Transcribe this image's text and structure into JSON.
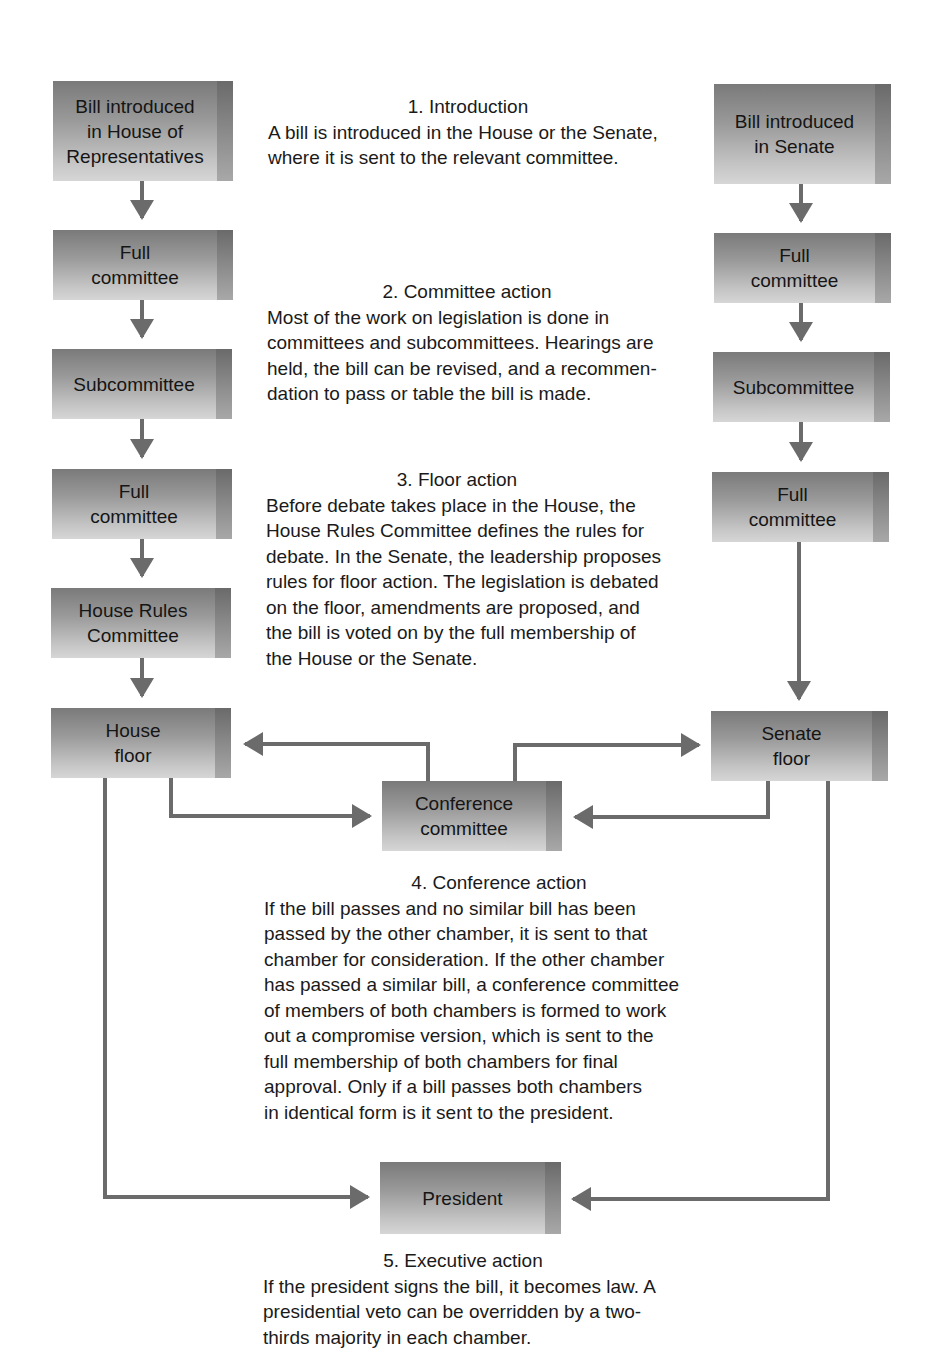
{
  "diagram": {
    "house": {
      "boxes": [
        {
          "label": "Bill introduced\nin House of\nRepresentatives"
        },
        {
          "label": "Full\ncommittee"
        },
        {
          "label": "Subcommittee"
        },
        {
          "label": "Full\ncommittee"
        },
        {
          "label": "House Rules\nCommittee"
        },
        {
          "label": "House\nfloor"
        }
      ]
    },
    "senate": {
      "boxes": [
        {
          "label": "Bill introduced\nin Senate"
        },
        {
          "label": "Full\ncommittee"
        },
        {
          "label": "Subcommittee"
        },
        {
          "label": "Full\ncommittee"
        },
        {
          "label": "Senate\nfloor"
        }
      ]
    },
    "conference": {
      "label": "Conference\ncommittee"
    },
    "president": {
      "label": "President"
    },
    "colors": {
      "box_dark": "#7a7a7a",
      "box_light": "#d6d6d6",
      "arrow": "#6b6b6b",
      "text": "#1a1a1a"
    }
  },
  "steps": [
    {
      "title": "1.  Introduction",
      "body": "A bill is introduced in the House or the Senate,\nwhere it is sent to the relevant committee."
    },
    {
      "title": "2.  Committee action",
      "body": "Most of the work on legislation is done in\ncommittees and subcommittees. Hearings are\nheld, the bill can be revised, and a recommen-\ndation to pass or table the bill is made."
    },
    {
      "title": "3.  Floor action",
      "body": "Before debate takes place in the House, the\nHouse Rules Committee defines the rules for\ndebate. In the Senate, the leadership proposes\nrules for floor action. The legislation is debated\non the floor, amendments are proposed, and\nthe bill is voted on by the full membership of\nthe House or the Senate."
    },
    {
      "title": "4.  Conference action",
      "body": "If the bill passes and no similar bill has been\npassed by the other chamber, it is sent to that\nchamber for consideration. If the other chamber\nhas passed a similar bill, a conference committee\nof members of both chambers is formed to work\nout a compromise version, which is sent to the\nfull membership of both chambers for final\napproval. Only if a bill passes both chambers\nin identical form is it sent to the president."
    },
    {
      "title": "5.  Executive action",
      "body": "If the president signs the bill, it becomes law. A\npresidential veto can be overridden by a two-\nthirds majority in each chamber."
    }
  ]
}
